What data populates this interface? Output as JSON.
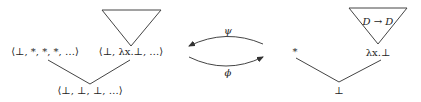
{
  "diagram": {
    "left_domain": {
      "nodes": {
        "top_left": "⟨⊥, *, *, *, …⟩",
        "top_right": "⟨⊥, λx.⊥, …⟩",
        "bottom": "⟨⊥, ⊥, ⊥, …⟩"
      },
      "triangle_label": ""
    },
    "arrows": {
      "top": {
        "label": "ψ",
        "direction": "right-to-left"
      },
      "bottom": {
        "label": "ϕ",
        "direction": "left-to-right"
      }
    },
    "right_domain": {
      "nodes": {
        "top_left": "*",
        "top_right": "λx.⊥",
        "bottom": "⊥"
      },
      "triangle_label": "D → D"
    }
  }
}
